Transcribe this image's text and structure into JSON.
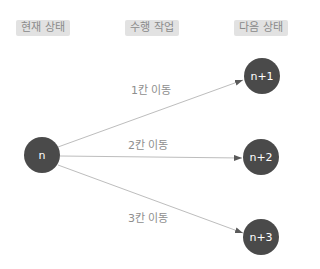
{
  "headers": {
    "current_state": "현재 상태",
    "action": "수행 작업",
    "next_state": "다음 상태"
  },
  "nodes": {
    "source": "n",
    "targets": [
      "n+1",
      "n+2",
      "n+3"
    ]
  },
  "edges": [
    {
      "label": "1칸 이동",
      "from": "n",
      "to": "n+1"
    },
    {
      "label": "2칸 이동",
      "from": "n",
      "to": "n+2"
    },
    {
      "label": "3칸 이동",
      "from": "n",
      "to": "n+3"
    }
  ],
  "colors": {
    "node_fill": "#4a4a4a",
    "node_text": "#ffffff",
    "edge_line": "#bdbdbd",
    "arrowhead": "#5a5a5a",
    "header_bg": "#e2e2e2",
    "header_text": "#8a8a8a",
    "edge_label_text": "#8e8e8e"
  }
}
